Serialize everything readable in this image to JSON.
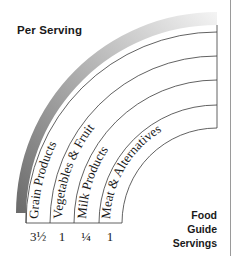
{
  "header": {
    "title": "Per Serving"
  },
  "legend": {
    "line1": "Food",
    "line2": "Guide",
    "line3": "Servings"
  },
  "groups": [
    {
      "label": "Grain Products",
      "servings": "3½"
    },
    {
      "label": "Vegetables & Fruit",
      "servings": "1"
    },
    {
      "label": "Milk Products",
      "servings": "¼"
    },
    {
      "label": "Meat & Alternatives",
      "servings": "1"
    }
  ],
  "colors": {
    "outline": "#3a3a3a",
    "band_dark": "#6f6f6f",
    "band_light": "#f0f0f0",
    "text": "#1a1a1a"
  }
}
